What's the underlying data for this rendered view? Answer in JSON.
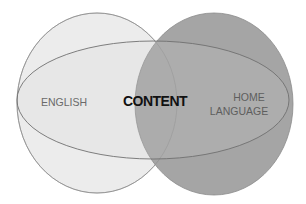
{
  "diagram": {
    "type": "venn",
    "sets": [
      {
        "id": "english",
        "label": "ENGLISH",
        "fill": "#ececec",
        "stroke": "#8c8c8c"
      },
      {
        "id": "home_language",
        "label_lines": [
          "HOME",
          "LANGUAGE"
        ],
        "fill": "#a0a0a0",
        "stroke": "#8a8a8a"
      },
      {
        "id": "content",
        "label": "CONTENT",
        "fill": "rgba(200,200,200,0.25)",
        "stroke": "#6f6f6f"
      }
    ],
    "labels": {
      "english": "ENGLISH",
      "content": "CONTENT",
      "home_line1": "HOME",
      "home_line2": "LANGUAGE"
    },
    "colors": {
      "background": "#ffffff",
      "left_circle_fill": "#ececec",
      "right_circle_fill": "#a0a0a0",
      "outline": "#7a7a7a",
      "label_gray": "#6a6a6a",
      "content_label": "#111111"
    }
  }
}
